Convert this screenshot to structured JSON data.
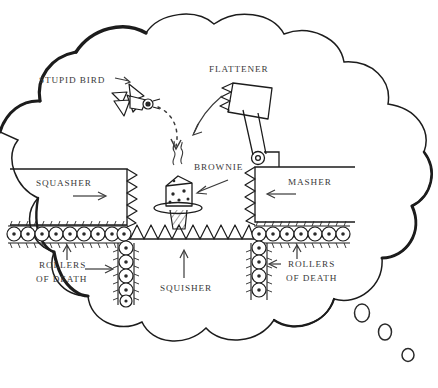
{
  "diagram": {
    "style": "hand-drawn black ink on white",
    "container": "thought-bubble cloud with three trailing circles at lower right"
  },
  "labels": {
    "stupid_bird": "STUPID BIRD",
    "flattener": "FLATTENER",
    "brownie": "BROWNIE",
    "squasher": "SQUASHER",
    "masher": "MASHER",
    "squisher": "SQUISHER",
    "rollers_of_death_left_line1": "ROLLERS",
    "rollers_of_death_left_line2": "OF DEATH",
    "rollers_of_death_right_line1": "ROLLERS",
    "rollers_of_death_right_line2": "OF DEATH"
  },
  "elements": {
    "bird": {
      "name": "stupid-bird",
      "description": "angular bird with wings, round eye and beak, dotted flight arc toward brownie"
    },
    "flattener": {
      "name": "flattener-hammer",
      "description": "hammer head with sawtooth face on a pivoting arm hinged above the masher"
    },
    "brownie": {
      "name": "brownie",
      "description": "speckled cube on an oval plate atop a hatched pedestal, with steam wisps"
    },
    "squasher": {
      "name": "squasher-block",
      "description": "left block with sawtooth right edge, moving right"
    },
    "masher": {
      "name": "masher-block",
      "description": "right block with sawtooth left edge, moving left"
    },
    "squisher": {
      "name": "squisher-floor",
      "description": "row of sawtooth spikes forming the floor, pushing up"
    },
    "rollers": {
      "name": "rollers-of-death",
      "description": "banks of spiked rollers drawn as circles with center dots"
    }
  },
  "arrows": {
    "squasher_direction": "right",
    "masher_direction": "left",
    "squisher_direction": "up",
    "flattener_direction": "down-left swing",
    "bird_path": "dotted arc descending to the brownie"
  },
  "colors": {
    "ink": "#1c1c1c",
    "ink_soft": "#3a3a3a",
    "paper": "#ffffff"
  }
}
